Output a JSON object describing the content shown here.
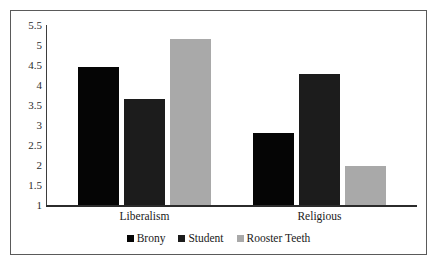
{
  "chart_data": {
    "type": "bar",
    "title": "",
    "subtitle": "",
    "xlabel": "",
    "ylabel": "",
    "categories": [
      "Liberalism",
      "Religious"
    ],
    "series": [
      {
        "name": "Brony",
        "color": "#050505",
        "values": [
          4.45,
          2.8
        ]
      },
      {
        "name": "Student",
        "color": "#1c1c1c",
        "values": [
          3.65,
          4.28
        ]
      },
      {
        "name": "Rooster Teeth",
        "color": "#a9a9a9",
        "values": [
          5.15,
          1.98
        ]
      }
    ],
    "ylim": [
      1,
      5.5
    ],
    "yticks": [
      1,
      1.5,
      2,
      2.5,
      3,
      3.5,
      4,
      4.5,
      5,
      5.5
    ],
    "ytick_labels": [
      "1",
      "1.5",
      "2",
      "2.5",
      "3",
      "3.5",
      "4",
      "4.5",
      "5",
      "5.5"
    ],
    "grid": false,
    "legend_position": "bottom",
    "frame": true,
    "annotations": []
  },
  "legend": {
    "items": [
      {
        "label": "Brony"
      },
      {
        "label": "Student"
      },
      {
        "label": "Rooster Teeth"
      }
    ]
  }
}
